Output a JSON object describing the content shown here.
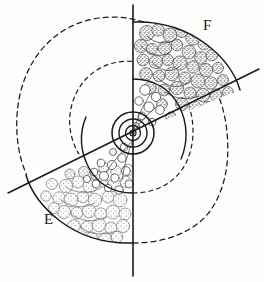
{
  "figure": {
    "background_color": "#fdfdfc",
    "ink_color": "#1a1a1a",
    "center": {
      "x": 133,
      "y": 133
    },
    "labels": [
      {
        "id": "F",
        "text": "F",
        "x": 203,
        "y": 17,
        "region": "upper-right-sector"
      },
      {
        "id": "E",
        "text": "E",
        "x": 44,
        "y": 211,
        "region": "lower-left-sector"
      }
    ],
    "axes": {
      "vertical": {
        "x": 133,
        "y_top": 5,
        "y_bottom": 276,
        "style": "solid"
      },
      "diagonal": {
        "x1": 8,
        "y1": 193,
        "x2": 259,
        "y2": 69,
        "style": "solid",
        "angle_deg": -26
      }
    },
    "center_rings": [
      {
        "r": 3.0,
        "style": "solid"
      },
      {
        "r": 7.5,
        "style": "solid"
      },
      {
        "r": 14.0,
        "style": "solid"
      },
      {
        "r": 21.0,
        "style": "solid"
      }
    ],
    "center_dot": {
      "r": 1.6,
      "fill": "#1a1a1a"
    },
    "dashed_spirals": [
      {
        "id": "outer-dashed-spiral",
        "style": "dashed",
        "dash": "5,4"
      },
      {
        "id": "inner-dashed-spiral",
        "style": "dashed",
        "dash": "4,4"
      }
    ],
    "solid_spirals": [
      {
        "id": "outer-solid-sector-boundary",
        "style": "solid"
      },
      {
        "id": "inner-solid-sector-boundary",
        "style": "solid"
      }
    ],
    "regions": [
      {
        "id": "F",
        "label": "F",
        "fill_pattern": "dense-dark-stipple-clusters",
        "cell_count": 46,
        "cell_tone": "dark",
        "description": "upper-right sector bounded by vertical axis and diagonal line"
      },
      {
        "id": "E",
        "label": "E",
        "fill_pattern": "medium-light-stipple-clusters",
        "cell_count": 40,
        "cell_tone": "light",
        "description": "lower-left sector bounded by vertical axis and diagonal line"
      },
      {
        "id": "inner-zone",
        "label": "",
        "fill_pattern": "small-open-outline-circles",
        "cell_count": 22,
        "cell_tone": "open",
        "description": "inner annular wedge near the center rings"
      }
    ]
  }
}
